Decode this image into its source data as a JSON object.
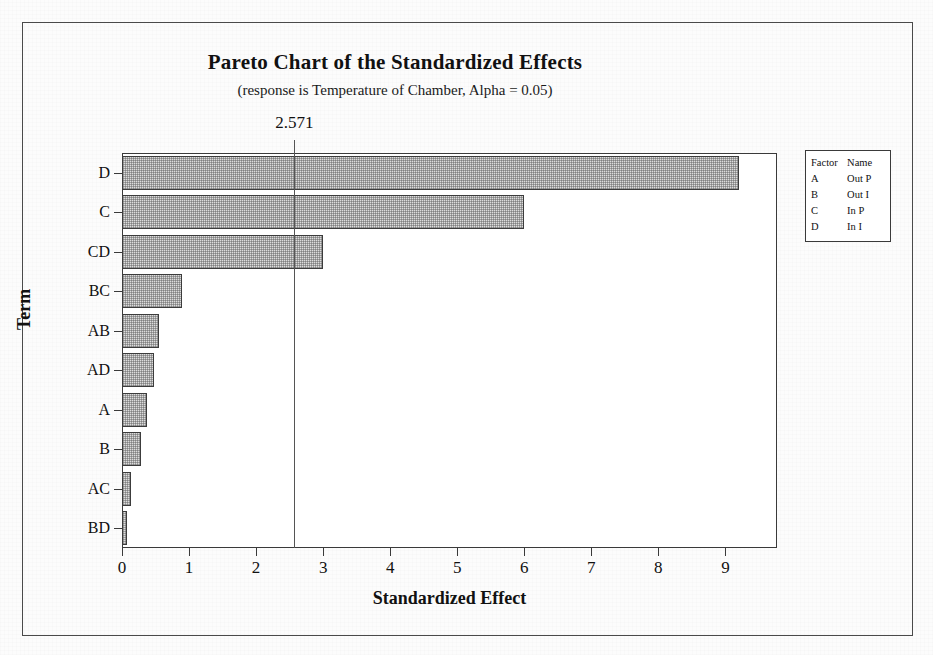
{
  "chart_data": {
    "type": "bar",
    "orientation": "horizontal",
    "title": "Pareto Chart of the Standardized Effects",
    "subtitle": "(response is Temperature of Chamber, Alpha = 0.05)",
    "xlabel": "Standardized Effect",
    "ylabel": "Term",
    "categories": [
      "D",
      "C",
      "CD",
      "BC",
      "AB",
      "AD",
      "A",
      "B",
      "AC",
      "BD"
    ],
    "values": [
      9.2,
      6.0,
      3.0,
      0.9,
      0.55,
      0.47,
      0.37,
      0.28,
      0.13,
      0.08
    ],
    "xlim": [
      0,
      9.77
    ],
    "xticks": [
      "0",
      "1",
      "2",
      "3",
      "4",
      "5",
      "6",
      "7",
      "8",
      "9"
    ],
    "xtick_values": [
      0,
      1,
      2,
      3,
      4,
      5,
      6,
      7,
      8,
      9
    ],
    "grid": false,
    "reference_line": {
      "value": 2.571,
      "label": "2.571",
      "alpha": 0.05
    },
    "bar_fill_color": "#dcdcdc",
    "bar_border_color": "#3c3c3c",
    "legend_position": "right-outside"
  },
  "legend": {
    "headers": {
      "factor": "Factor",
      "name": "Name"
    },
    "rows": [
      {
        "factor": "A",
        "name": "Out P"
      },
      {
        "factor": "B",
        "name": "Out I"
      },
      {
        "factor": "C",
        "name": "In P"
      },
      {
        "factor": "D",
        "name": "In I"
      }
    ]
  }
}
